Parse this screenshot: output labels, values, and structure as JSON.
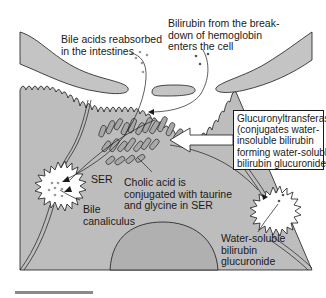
{
  "figure": {
    "type": "hepatocyte bile/bilirubin pathway diagram",
    "colors": {
      "background": "#ffffff",
      "cytoplasm": "#bdbdbd",
      "sinusoid": "#c4c4c4",
      "nucleus": "#b0b0b0",
      "outline": "#1a1a1a",
      "canaliculus": "#ffffff",
      "dots": "#9a9a9a",
      "scale_bar": "#8a8a8a"
    }
  },
  "labels": {
    "bile_acids": "Bile acids reabsorbed\nin the intestines",
    "bilirubin_entry": "Bilirubin from the break-\ndown of hemoglobin\nenters the cell",
    "enzyme": "Glucuronyltransferase\n(conjugates water-\ninsoluble bilirubin\nforming water-soluble\nbilirubin glucuronide)",
    "ser": "SER",
    "cholic_acid": "Cholic acid is\nconjugated with taurine\nand glycine in SER",
    "bile_canaliculus": "Bile\ncanaliculus",
    "water_soluble": "Water-soluble\nbilirubin\nglucuronide"
  },
  "structures": [
    "sinusoid-left",
    "sinusoid-center",
    "sinusoid-right",
    "microvilli-border",
    "hepatocyte-cytoplasm",
    "smooth-endoplasmic-reticulum",
    "bile-canaliculus-left",
    "bile-canaliculus-right",
    "nucleus",
    "cell-junctions",
    "scale-bar"
  ]
}
